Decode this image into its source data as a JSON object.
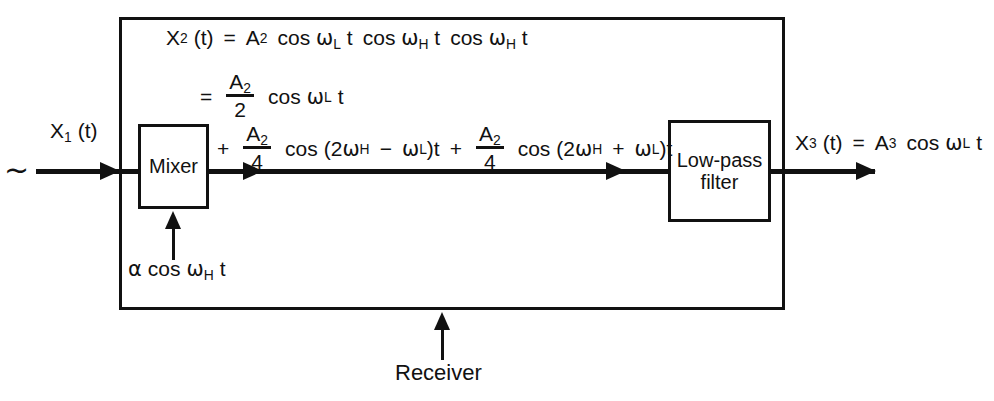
{
  "diagram": {
    "title_label": "Receiver",
    "source_symbol": "~",
    "input_signal": {
      "name": "X",
      "sub": "1",
      "arg": "(t)",
      "full": "X₁ (t)"
    },
    "local_oscillator": {
      "alpha": "α",
      "cos": "cos",
      "omega": "ω",
      "sub": "H",
      "t": "t",
      "full": "α cos ω_H t"
    },
    "blocks": [
      {
        "id": "mixer",
        "label": "Mixer"
      },
      {
        "id": "low-pass-filter",
        "label": "Low-pass\nfilter",
        "line1": "Low-pass",
        "line2": "filter"
      }
    ],
    "output_signal": {
      "full": "X₃ (t) = A₃ cos ω_L t",
      "lhs_name": "X",
      "lhs_sub": "3",
      "lhs_arg": "(t)",
      "equals": "=",
      "amp": "A",
      "amp_sub": "3",
      "cos": "cos",
      "omega": "ω",
      "omega_sub": "L",
      "t": "t"
    },
    "equation": {
      "line1": {
        "lhs": "X",
        "lhs_sub": "2",
        "lhs_arg": "(t)",
        "equals": "=",
        "amp": "A",
        "amp_sub": "2",
        "term1": "cos ω_L t",
        "term2": "cos ω_H t",
        "term3": "cos ω_H t",
        "plain": "X₂ (t) = A₂ cos ω_L t cos ω_H t cos ω_H t"
      },
      "line2": {
        "equals": "=",
        "num": "A",
        "num_sub": "2",
        "den": "2",
        "cos": "cos",
        "omega": "ω",
        "omega_sub": "L",
        "t": "t",
        "plain": "= (A₂/2) cos ω_L t"
      },
      "line3": {
        "plus1": "+",
        "num1": "A",
        "num1_sub": "2",
        "den1": "4",
        "cos1": "cos",
        "open1": "(2",
        "omega1": "ω",
        "omega1_sub": "H",
        "minus": "−",
        "omega2": "ω",
        "omega2_sub": "L",
        "close1": ")t",
        "plus2": "+",
        "num2": "A",
        "num2_sub": "2",
        "den2": "4",
        "cos2": "cos",
        "open2": "(2",
        "omega3": "ω",
        "omega3_sub": "H",
        "plus3": "+",
        "omega4": "ω",
        "omega4_sub": "L",
        "close2": ")t",
        "plain": "+ (A₂/4) cos (2ω_H − ω_L)t + (A₂/4) cos (2ω_H + ω_L)t"
      }
    },
    "colors": {
      "ink": "#111111",
      "background": "#ffffff"
    }
  }
}
